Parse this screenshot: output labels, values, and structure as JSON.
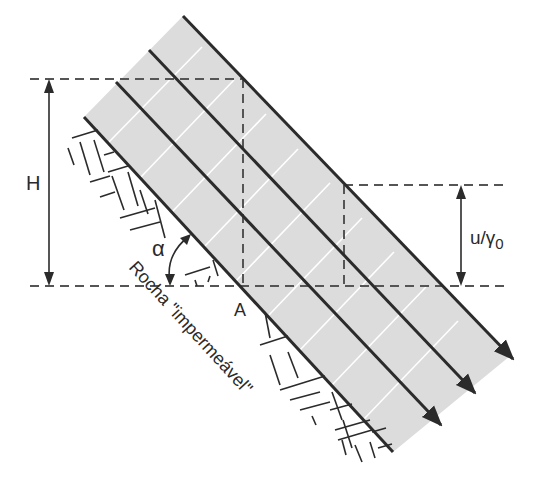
{
  "diagram": {
    "type": "infinite-slope-seepage",
    "labels": {
      "height": "H",
      "pressure_head_main": "u/γ",
      "pressure_head_sub": "0",
      "angle": "α",
      "point": "A",
      "rock": "Rocha \"impermeável\""
    },
    "colors": {
      "soil_fill": "#dcdcdc",
      "line": "#2b2b2b",
      "dash": "#555555",
      "equipotential": "#ffffff"
    },
    "flow_lines_count": 4
  }
}
